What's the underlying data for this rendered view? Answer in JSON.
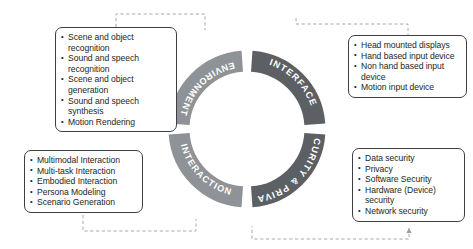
{
  "diagram": {
    "type": "circular-segmented-ring",
    "colors": {
      "segment_light": "#8f9296",
      "segment_dark": "#5c5f63",
      "label_text": "#ffffff",
      "box_border": "#3d3f42",
      "box_text": "#1d1f21",
      "connector": "#9a9ea2",
      "background": "#ffffff"
    },
    "ring": {
      "center_x": 247,
      "center_y": 129,
      "radius": 68,
      "stroke_width": 21,
      "gap_positions_oclock": [
        12,
        3,
        6,
        9
      ],
      "segments": [
        {
          "id": "environment",
          "label": "ENVIRONMENT",
          "shade": "light",
          "position": "top-left",
          "start_angle_deg": 184,
          "end_angle_deg": 266
        },
        {
          "id": "interface",
          "label": "INTERFACE",
          "shade": "dark",
          "position": "top-right",
          "start_angle_deg": 274,
          "end_angle_deg": 356
        },
        {
          "id": "security_privacy",
          "label": "SECURITY & PRIVACY",
          "shade": "dark",
          "position": "bottom-right",
          "start_angle_deg": 4,
          "end_angle_deg": 86
        },
        {
          "id": "interaction",
          "label": "INTERACTION",
          "shade": "light",
          "position": "bottom-left",
          "start_angle_deg": 94,
          "end_angle_deg": 176
        }
      ]
    },
    "boxes": {
      "environment": {
        "title": "ENVIRONMENT",
        "items": [
          "Scene and object recognition",
          "Sound and speech\nrecognition",
          "Scene and object generation",
          "Sound and speech synthesis",
          "Motion Rendering"
        ]
      },
      "interface": {
        "title": "INTERFACE",
        "items": [
          "Head mounted displays",
          "Hand based input device",
          "Non hand based input\ndevice",
          "Motion input device"
        ]
      },
      "interaction": {
        "title": "INTERACTION",
        "items": [
          "Multimodal Interaction",
          "Multi-task Interaction",
          "Embodied Interaction",
          "Persona Modeling",
          "Scenario Generation"
        ]
      },
      "security_privacy": {
        "title": "SECURITY & PRIVACY",
        "items": [
          "Data security",
          "Privacy",
          "Software Security",
          "Hardware (Device)\nsecurity",
          "Network security"
        ]
      }
    }
  }
}
